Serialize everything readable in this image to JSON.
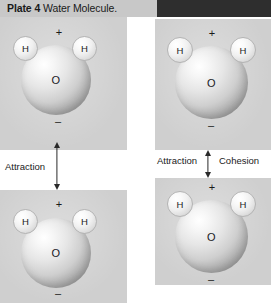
{
  "header": {
    "plate_label": "Plate 4",
    "title": "Water Molecule.",
    "disc_icon": "chevron-down-disc-icon"
  },
  "molecules": [
    {
      "id": "top-left",
      "oxygen_label": "O",
      "hydrogen_left_label": "H",
      "hydrogen_right_label": "H",
      "positive_charge": "+",
      "negative_charge": "–"
    },
    {
      "id": "top-right",
      "oxygen_label": "O",
      "hydrogen_left_label": "H",
      "hydrogen_right_label": "H",
      "positive_charge": "+",
      "negative_charge": "–"
    },
    {
      "id": "bottom-left",
      "oxygen_label": "O",
      "hydrogen_left_label": "H",
      "hydrogen_right_label": "H",
      "positive_charge": "+",
      "negative_charge": "–"
    },
    {
      "id": "bottom-right",
      "oxygen_label": "O",
      "hydrogen_left_label": "H",
      "hydrogen_right_label": "H",
      "positive_charge": "+",
      "negative_charge": "–"
    }
  ],
  "annotations": {
    "left_attraction": "Attraction",
    "right_attraction": "Attraction",
    "right_cohesion": "Cohesion"
  },
  "colors": {
    "header_light": "#c8c8c8",
    "header_dark": "#2e2e2e",
    "panel_gray": "#cfcfcf",
    "page_background": "#ffffff",
    "text": "#1a1a1a",
    "arrow": "#2a2a2a"
  }
}
